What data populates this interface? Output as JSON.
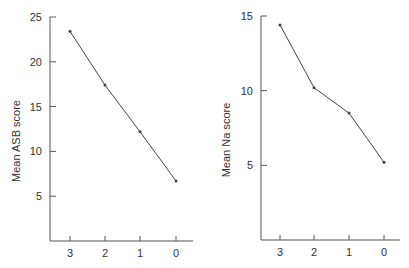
{
  "chart_data": [
    {
      "type": "line",
      "title": "",
      "xlabel": "",
      "ylabel": "Mean ASB score",
      "categories": [
        "3",
        "2",
        "1",
        "0"
      ],
      "values": [
        23.4,
        17.4,
        12.2,
        6.7
      ],
      "yticks": [
        5,
        10,
        15,
        20,
        25
      ],
      "ylim": [
        0,
        25
      ],
      "grid": false,
      "legend": null
    },
    {
      "type": "line",
      "title": "",
      "xlabel": "",
      "ylabel": "Mean Na score",
      "categories": [
        "3",
        "2",
        "1",
        "0"
      ],
      "values": [
        14.4,
        10.2,
        8.5,
        5.2
      ],
      "yticks": [
        5,
        10,
        15
      ],
      "ylim": [
        0,
        15
      ],
      "grid": false,
      "legend": null
    }
  ],
  "style": {
    "line_color": "#444444",
    "axis_color": "#555555"
  }
}
